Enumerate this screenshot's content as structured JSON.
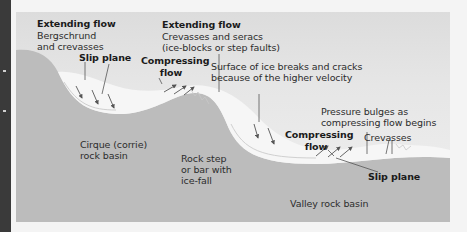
{
  "diagram": {
    "colors": {
      "rock": "#bcbcbc",
      "ice": "#f6f6f6",
      "background": "#e2e2e2",
      "edge_strip": "#3a3a3a",
      "text": "#2c2c2c"
    },
    "labels": {
      "extending_flow_1": "Extending flow",
      "bergschrund_line1": "Bergschrund",
      "bergschrund_line2": "and crevasses",
      "slip_plane_1": "Slip plane",
      "extending_flow_2": "Extending flow",
      "crevasses_seracs_line1": "Crevasses and seracs",
      "crevasses_seracs_line2": "(ice-blocks or step faults)",
      "compressing_flow_1_line1": "Compressing",
      "compressing_flow_1_line2": "flow",
      "surface_breaks_line1": "Surface of ice breaks and cracks",
      "surface_breaks_line2": "because of the higher velocity",
      "pressure_bulges_line1": "Pressure bulges as",
      "pressure_bulges_line2": "compressing flow begins",
      "compressing_flow_2_line1": "Compressing",
      "compressing_flow_2_line2": "flow",
      "crevasses": "Crevasses",
      "slip_plane_2": "Slip plane",
      "cirque_line1": "Cirque (corrie)",
      "cirque_line2": "rock basin",
      "rock_step_line1": "Rock step",
      "rock_step_line2": "or bar with",
      "rock_step_line3": "ice-fall",
      "valley_basin": "Valley rock basin"
    }
  }
}
